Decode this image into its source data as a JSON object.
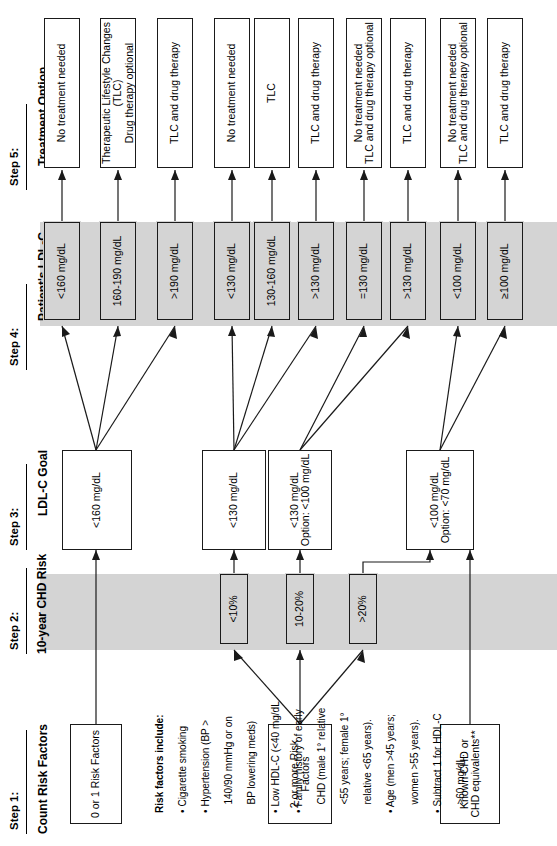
{
  "figure": {
    "orientation": "rotated-90-ccw",
    "background": "#ffffff",
    "band_color": "#d4d4d4",
    "line_color": "#1a1a1a"
  },
  "steps": [
    {
      "key": "step1",
      "label": "Step 1:",
      "title": "Count Risk Factors",
      "title_lines": [
        "Count Risk Factors"
      ]
    },
    {
      "key": "step2",
      "label": "Step 2:",
      "title": "10-year CHD Risk",
      "title_lines": [
        "10-year",
        "CHD Risk"
      ]
    },
    {
      "key": "step3",
      "label": "Step 3:",
      "title": "LDL-C Goal",
      "title_lines": [
        "LDL-C Goal"
      ]
    },
    {
      "key": "step4",
      "label": "Step 4:",
      "title": "Patient's LDL-C",
      "title_lines": [
        "Patient's LDL-C"
      ]
    },
    {
      "key": "step5",
      "label": "Step 5:",
      "title": "Treatment Option",
      "title_lines": [
        "Treatment Option"
      ]
    }
  ],
  "risk_groups": [
    {
      "id": "g1",
      "label": "0 or 1 Risk Factors"
    },
    {
      "id": "g2",
      "label": "2 or more Risk Factors"
    },
    {
      "id": "g3",
      "label": "Known CHD or CHD equivalents**",
      "lines": [
        "Known CHD or",
        "CHD equivalents**"
      ]
    }
  ],
  "chd_risk": [
    {
      "id": "r1",
      "label": "<10%"
    },
    {
      "id": "r2",
      "label": "10-20%"
    },
    {
      "id": "r3",
      "label": ">20%"
    }
  ],
  "ldl_goals": [
    {
      "id": "goal1",
      "lines": [
        "<160 mg/dL"
      ]
    },
    {
      "id": "goal2",
      "lines": [
        "<130 mg/dL"
      ]
    },
    {
      "id": "goal3",
      "lines": [
        "<130 mg/dL",
        "Option: <100 mg/dL"
      ]
    },
    {
      "id": "goal4",
      "lines": [
        "<100 mg/dL",
        "Option: <70 mg/dL"
      ]
    }
  ],
  "patient_ldl": [
    {
      "id": "p1",
      "label": "<160 mg/dL"
    },
    {
      "id": "p2",
      "label": "160-190 mg/dL"
    },
    {
      "id": "p3",
      "label": ">190 mg/dL"
    },
    {
      "id": "p4",
      "label": "<130 mg/dL"
    },
    {
      "id": "p5",
      "label": "130-160 mg/dL"
    },
    {
      "id": "p6",
      "label": ">130 mg/dL"
    },
    {
      "id": "p7",
      "label": "=130 mg/dL"
    },
    {
      "id": "p8",
      "label": ">130 mg/dL"
    },
    {
      "id": "p9",
      "label": "<100 mg/dL"
    },
    {
      "id": "p10",
      "label": "≥100 mg/dL"
    }
  ],
  "treatments": [
    {
      "id": "t1",
      "lines": [
        "No treatment needed"
      ]
    },
    {
      "id": "t2",
      "lines": [
        "Therapeutic Lifestyle Changes (TLC)",
        "Drug therapy optional"
      ]
    },
    {
      "id": "t3",
      "lines": [
        "TLC and drug therapy"
      ]
    },
    {
      "id": "t4",
      "lines": [
        "No treatment needed"
      ]
    },
    {
      "id": "t5",
      "lines": [
        "TLC"
      ]
    },
    {
      "id": "t6",
      "lines": [
        "TLC and drug therapy"
      ]
    },
    {
      "id": "t7",
      "lines": [
        "No treatment needed",
        "TLC and drug therapy optional"
      ]
    },
    {
      "id": "t8",
      "lines": [
        "TLC and drug therapy"
      ]
    },
    {
      "id": "t9",
      "lines": [
        "No treatment needed",
        "TLC and drug therapy optional"
      ]
    },
    {
      "id": "t10",
      "lines": [
        "TLC and drug therapy"
      ]
    }
  ],
  "notes": {
    "heading": "Risk factors include:",
    "items": [
      "• Cigarette smoking",
      "• Hypertension (BP >",
      "   140/90 mmHg or on",
      "   BP lowering meds)",
      "• Low HDL-C (<40 mg/dL",
      "• Family history of early",
      "   CHD (male 1° relative",
      "   <55 years; female 1°",
      "   relative <65 years).",
      "• Age (men >45 years;",
      "   women >55 years).",
      "• Subtract 1 for HDL-C",
      "   >60 mg/dL."
    ]
  }
}
